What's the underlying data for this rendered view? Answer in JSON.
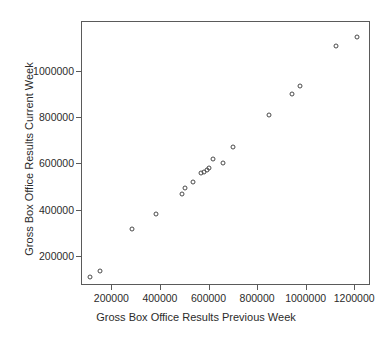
{
  "chart_data": {
    "type": "scatter",
    "title": "",
    "xlabel": "Gross Box Office Results Previous Week",
    "ylabel": "Gross Box Office Results Current Week",
    "xlim": [
      75000,
      1265000
    ],
    "ylim": [
      75000,
      1215000
    ],
    "grid": false,
    "legend": null,
    "xticks": [
      200000,
      400000,
      600000,
      800000,
      1000000,
      1200000
    ],
    "yticks": [
      200000,
      400000,
      600000,
      800000,
      1000000
    ],
    "xticklabels": [
      "200000",
      "400000",
      "600000",
      "800000",
      "1000000",
      "1200000"
    ],
    "yticklabels": [
      "200000",
      "400000",
      "600000",
      "800000",
      "1000000"
    ],
    "marker": "open-circle",
    "marker_color": "#4a4a4a",
    "points": [
      {
        "x": 110000,
        "y": 110000
      },
      {
        "x": 155000,
        "y": 135000
      },
      {
        "x": 285000,
        "y": 318000
      },
      {
        "x": 383000,
        "y": 383000
      },
      {
        "x": 492000,
        "y": 470000
      },
      {
        "x": 505000,
        "y": 495000
      },
      {
        "x": 535000,
        "y": 521000
      },
      {
        "x": 568000,
        "y": 560000
      },
      {
        "x": 580000,
        "y": 565000
      },
      {
        "x": 592000,
        "y": 573000
      },
      {
        "x": 604000,
        "y": 580000
      },
      {
        "x": 618000,
        "y": 617000
      },
      {
        "x": 658000,
        "y": 600000
      },
      {
        "x": 700000,
        "y": 672000
      },
      {
        "x": 848000,
        "y": 810000
      },
      {
        "x": 943000,
        "y": 898000
      },
      {
        "x": 975000,
        "y": 935000
      },
      {
        "x": 1125000,
        "y": 1105000
      },
      {
        "x": 1212000,
        "y": 1148000
      }
    ]
  }
}
